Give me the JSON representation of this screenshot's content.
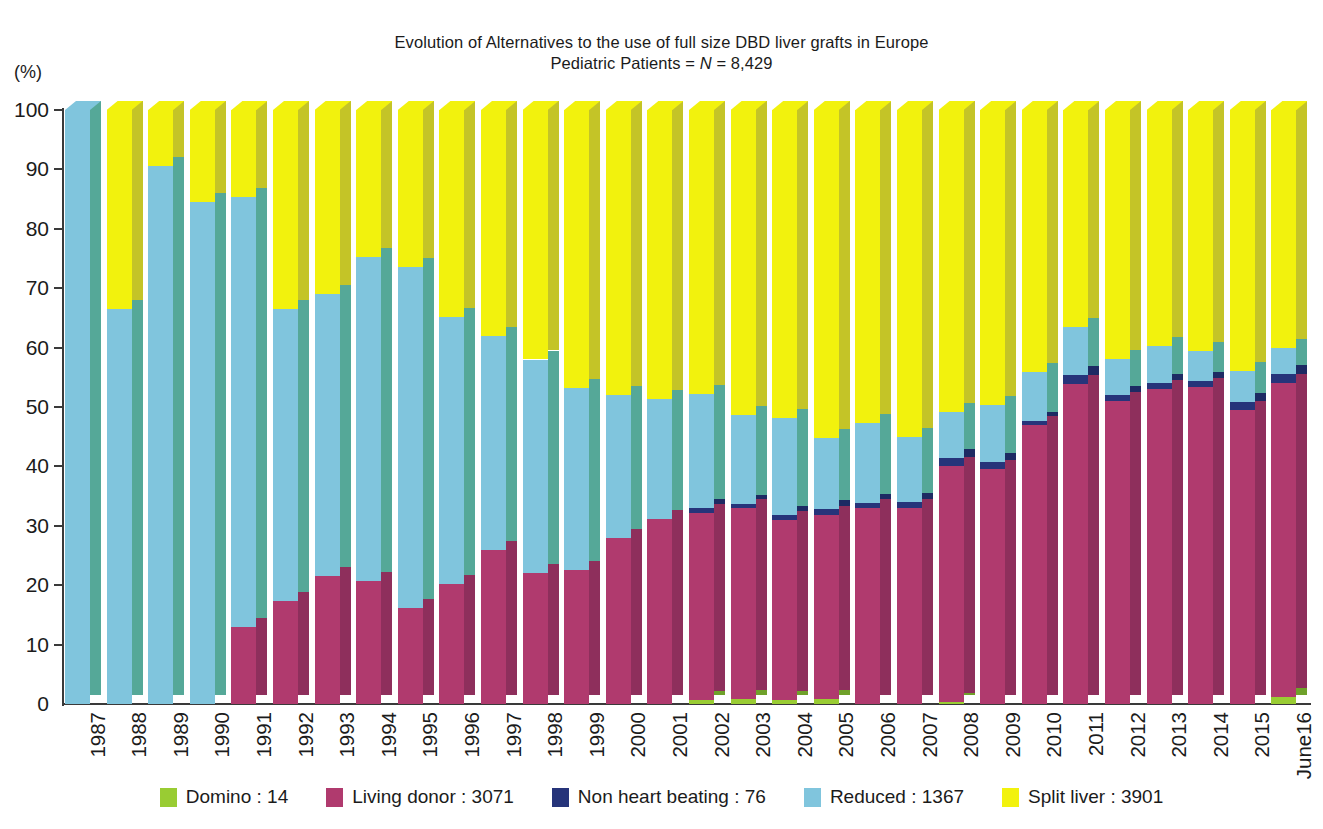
{
  "title": {
    "line1": "Evolution of Alternatives to the use of full size DBD liver grafts in Europe",
    "line2_prefix": "Pediatric Patients = ",
    "line2_italic": "N",
    "line2_suffix": " = 8,429"
  },
  "axis": {
    "y_unit": "(%)",
    "y_ticks": [
      "100",
      "90",
      "80",
      "70",
      "60",
      "50",
      "40",
      "30",
      "20",
      "10",
      "0"
    ],
    "ylim": [
      0,
      100
    ]
  },
  "colors": {
    "domino": "#99cc33",
    "living_donor": "#b03a6e",
    "non_heart_beating": "#26347a",
    "reduced": "#80c5dd",
    "split_liver": "#f2f20d",
    "side_shade_domino": "#6fa12a",
    "side_shade_living": "#8e2f5c",
    "side_shade_nhb": "#1d2a63",
    "side_shade_reduced": "#55a898",
    "side_shade_split": "#c4c427",
    "axis": "#3a3a3a",
    "text": "#1b1b1b"
  },
  "legend": {
    "items": [
      {
        "label": "Domino : 14",
        "color": "#99cc33",
        "key": "domino"
      },
      {
        "label": "Living donor : 3071",
        "color": "#b03a6e",
        "key": "living_donor"
      },
      {
        "label": "Non heart beating : 76",
        "color": "#26347a",
        "key": "non_heart_beating"
      },
      {
        "label": "Reduced : 1367",
        "color": "#80c5dd",
        "key": "reduced"
      },
      {
        "label": "Split liver : 3901",
        "color": "#f2f20d",
        "key": "split_liver"
      }
    ]
  },
  "chart_data": {
    "type": "bar",
    "stacked": true,
    "xlabel": "",
    "ylabel": "(%)",
    "ylim": [
      0,
      100
    ],
    "grid": false,
    "legend_position": "bottom",
    "categories": [
      "1987",
      "1988",
      "1989",
      "1990",
      "1991",
      "1992",
      "1993",
      "1994",
      "1995",
      "1996",
      "1997",
      "1998",
      "1999",
      "2000",
      "2001",
      "2002",
      "2003",
      "2004",
      "2005",
      "2006",
      "2007",
      "2008",
      "2009",
      "2010",
      "2011",
      "2012",
      "2013",
      "2014",
      "2015",
      "June16"
    ],
    "series": [
      {
        "name": "Domino",
        "total": 14,
        "color": "#99cc33",
        "values": [
          0,
          0,
          0,
          0,
          0,
          0,
          0,
          0,
          0,
          0,
          0,
          0,
          0,
          0,
          0,
          0.7,
          0.8,
          0.7,
          0.8,
          0,
          0,
          0.4,
          0,
          0,
          0,
          0,
          0,
          0,
          0,
          1.2
        ]
      },
      {
        "name": "Living donor",
        "total": 3071,
        "color": "#b03a6e",
        "values": [
          0,
          0,
          0,
          0,
          13.0,
          17.3,
          21.6,
          20.7,
          16.2,
          20.2,
          25.9,
          22.0,
          22.6,
          28.0,
          31.2,
          31.5,
          32.2,
          30.2,
          31.0,
          33.0,
          33.0,
          39.6,
          39.5,
          47.0,
          53.8,
          51.0,
          53.0,
          53.3,
          49.5,
          52.8
        ]
      },
      {
        "name": "Non heart beating",
        "total": 76,
        "color": "#26347a",
        "values": [
          0,
          0,
          0,
          0,
          0,
          0,
          0,
          0,
          0,
          0,
          0,
          0,
          0,
          0,
          0,
          0.8,
          0.7,
          1.0,
          1.0,
          0.8,
          1.0,
          1.5,
          1.2,
          0.7,
          1.6,
          1.1,
          1.0,
          1.0,
          1.3,
          1.6
        ]
      },
      {
        "name": "Reduced",
        "total": 1367,
        "color": "#80c5dd",
        "values": [
          100.0,
          66.5,
          90.5,
          84.5,
          72.4,
          49.2,
          47.4,
          54.5,
          57.3,
          45.0,
          36.1,
          36.0,
          30.6,
          24.0,
          20.2,
          19.2,
          14.9,
          16.3,
          12.0,
          13.5,
          11.0,
          7.7,
          9.6,
          8.2,
          8.1,
          6.0,
          6.3,
          5.2,
          5.3,
          4.3
        ]
      },
      {
        "name": "Split liver",
        "total": 3901,
        "color": "#f2f20d",
        "values": [
          0,
          33.5,
          9.5,
          15.5,
          14.6,
          33.5,
          31.0,
          24.8,
          26.5,
          34.8,
          38.0,
          42.0,
          46.8,
          48.0,
          48.6,
          47.8,
          51.4,
          51.8,
          55.2,
          52.7,
          55.0,
          50.8,
          49.7,
          44.1,
          36.5,
          41.9,
          39.7,
          40.5,
          43.9,
          40.1
        ]
      }
    ]
  }
}
